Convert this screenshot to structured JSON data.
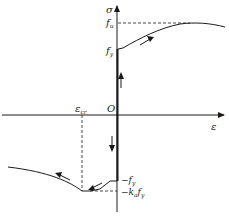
{
  "diagram": {
    "type": "stress-strain curve",
    "axes": {
      "y_label": "σ",
      "x_label": "ε",
      "origin_label": "O"
    },
    "labels": {
      "fu": "f",
      "fu_sub": "u",
      "fy": "f",
      "fy_sub": "y",
      "neg_fy": "−f",
      "neg_fy_sub": "y",
      "neg_ka_fy": "−k",
      "neg_ka_sub": "a",
      "neg_ka_f": "f",
      "neg_ka_f_sub": "y",
      "eps_cr": "ε",
      "eps_cr_sub": "cr"
    },
    "colors": {
      "line": "#1a1a1a",
      "background": "#ffffff"
    }
  }
}
